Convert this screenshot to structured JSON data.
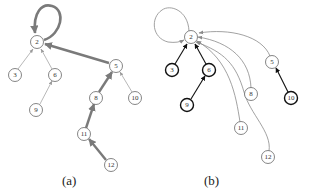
{
  "figure": {
    "panels": [
      {
        "id": "a",
        "caption": "(a)",
        "nodes": [
          {
            "id": "2",
            "label": "2",
            "x": 37,
            "y": 42,
            "bold": false
          },
          {
            "id": "3",
            "label": "3",
            "x": 15,
            "y": 75,
            "bold": false
          },
          {
            "id": "6",
            "label": "6",
            "x": 55,
            "y": 75,
            "bold": false
          },
          {
            "id": "9",
            "label": "9",
            "x": 36,
            "y": 110,
            "bold": false
          },
          {
            "id": "5",
            "label": "5",
            "x": 116,
            "y": 66,
            "bold": false
          },
          {
            "id": "10",
            "label": "10",
            "x": 135,
            "y": 98,
            "bold": false
          },
          {
            "id": "8",
            "label": "8",
            "x": 96,
            "y": 98,
            "bold": false
          },
          {
            "id": "11",
            "label": "11",
            "x": 84,
            "y": 134,
            "bold": false
          },
          {
            "id": "12",
            "label": "12",
            "x": 111,
            "y": 165,
            "bold": false
          }
        ],
        "edges": [
          {
            "from": "2",
            "to": "2",
            "style": "thick-loop"
          },
          {
            "from": "3",
            "to": "2",
            "style": "thin"
          },
          {
            "from": "6",
            "to": "2",
            "style": "thin"
          },
          {
            "from": "9",
            "to": "6",
            "style": "thin"
          },
          {
            "from": "5",
            "to": "2",
            "style": "thick"
          },
          {
            "from": "10",
            "to": "5",
            "style": "thin"
          },
          {
            "from": "8",
            "to": "5",
            "style": "thick"
          },
          {
            "from": "11",
            "to": "8",
            "style": "thick"
          },
          {
            "from": "12",
            "to": "11",
            "style": "thick"
          }
        ]
      },
      {
        "id": "b",
        "caption": "(b)",
        "nodes": [
          {
            "id": "2",
            "label": "2",
            "x": 191,
            "y": 37,
            "bold": false
          },
          {
            "id": "3",
            "label": "3",
            "x": 172,
            "y": 70,
            "bold": true
          },
          {
            "id": "6",
            "label": "6",
            "x": 209,
            "y": 70,
            "bold": true
          },
          {
            "id": "9",
            "label": "9",
            "x": 187,
            "y": 105,
            "bold": true
          },
          {
            "id": "5",
            "label": "5",
            "x": 272,
            "y": 62,
            "bold": false
          },
          {
            "id": "10",
            "label": "10",
            "x": 291,
            "y": 98,
            "bold": true
          },
          {
            "id": "8",
            "label": "8",
            "x": 251,
            "y": 94,
            "bold": false
          },
          {
            "id": "11",
            "label": "11",
            "x": 241,
            "y": 128,
            "bold": false
          },
          {
            "id": "12",
            "label": "12",
            "x": 268,
            "y": 157,
            "bold": false
          }
        ],
        "edges": [
          {
            "from": "2",
            "to": "2",
            "style": "gray-loop"
          },
          {
            "from": "3",
            "to": "2",
            "style": "black"
          },
          {
            "from": "6",
            "to": "2",
            "style": "black"
          },
          {
            "from": "9",
            "to": "6",
            "style": "black"
          },
          {
            "from": "10",
            "to": "5",
            "style": "black"
          },
          {
            "from": "5",
            "to": "2",
            "style": "gray-curve"
          },
          {
            "from": "8",
            "to": "2",
            "style": "gray-curve"
          },
          {
            "from": "11",
            "to": "2",
            "style": "gray-curve"
          },
          {
            "from": "12",
            "to": "2",
            "style": "gray-curve"
          }
        ]
      }
    ],
    "colors": {
      "thick_edge": "#7a7a7a",
      "thin_edge": "#9a9a9a",
      "black_edge": "#111111",
      "gray_curve": "#8a8a8a",
      "node_stroke": "#666666",
      "bold_node_stroke": "#111111"
    }
  }
}
